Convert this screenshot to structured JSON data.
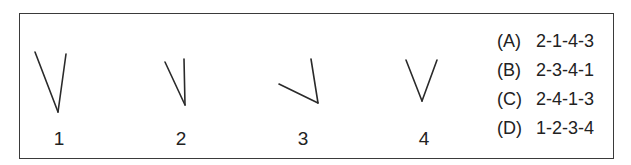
{
  "figures": [
    {
      "label": "1",
      "lines": [
        [
          35,
          52,
          58,
          112
        ],
        [
          58,
          112,
          66,
          54
        ]
      ]
    },
    {
      "label": "2",
      "lines": [
        [
          165,
          62,
          185,
          105
        ],
        [
          185,
          105,
          184,
          59
        ]
      ]
    },
    {
      "label": "3",
      "lines": [
        [
          279,
          84,
          318,
          103
        ],
        [
          318,
          103,
          311,
          59
        ]
      ]
    },
    {
      "label": "4",
      "lines": [
        [
          406,
          60,
          422,
          101
        ],
        [
          422,
          101,
          437,
          60
        ]
      ]
    }
  ],
  "options": [
    {
      "letter": "(A)",
      "sequence": "2-1-4-3"
    },
    {
      "letter": "(B)",
      "sequence": "2-3-4-1"
    },
    {
      "letter": "(C)",
      "sequence": "2-4-1-3"
    },
    {
      "letter": "(D)",
      "sequence": "1-2-3-4"
    }
  ],
  "colors": {
    "stroke": "#2a2a2a",
    "border": "#3a3a3a"
  }
}
